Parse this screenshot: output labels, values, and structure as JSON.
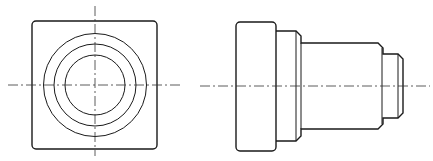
{
  "drawing": {
    "type": "orthographic-projection",
    "colors": {
      "line": "#1a1a1a",
      "centerline": "#333333",
      "background": "#ffffff"
    },
    "front_view": {
      "square": {
        "x": 32,
        "y": 21,
        "w": 125,
        "h": 128,
        "r": 4
      },
      "center": {
        "cx": 95,
        "cy": 85
      },
      "circles": [
        {
          "r": 51.5
        },
        {
          "r": 41
        },
        {
          "r": 30
        }
      ],
      "centerline_h": {
        "x1": 8,
        "x2": 180,
        "y": 85
      },
      "centerline_v": {
        "x": 95,
        "y1": 6,
        "y2": 156
      }
    },
    "side_view": {
      "centerline": {
        "x1": 200,
        "x2": 430,
        "y": 86
      },
      "flange": {
        "x": 236,
        "y": 22,
        "w": 40,
        "h": 129,
        "r": 4
      },
      "outline_path": "M276,31 L296,31 L301,36 L301,43 L378,43 L383,48 L383,54 L398,54 L403,59 L403,113 L398,118 L383,118 L383,124 L378,129 L301,129 L301,136 L296,141 L276,141",
      "inner_lines": [
        {
          "x": 296,
          "y1": 31,
          "y2": 141
        },
        {
          "x": 301,
          "y1": 43,
          "y2": 129
        },
        {
          "x": 382,
          "y1": 48,
          "y2": 124
        },
        {
          "x": 398,
          "y1": 54,
          "y2": 118
        }
      ]
    }
  }
}
